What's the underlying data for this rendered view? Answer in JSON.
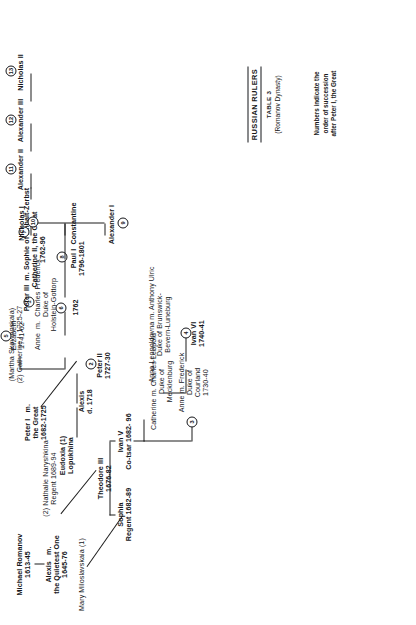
{
  "legend": {
    "title": "RUSSIAN RULERS",
    "table": "TABLE 3",
    "dynasty": "(Romanov Dynasty)",
    "note_line1": "Numbers indicate the",
    "note_line2": "order of succession",
    "note_line3": "after Peter I, the Great"
  },
  "tree": {
    "founder": "Michael Romanov\n1613-45",
    "alexis": "Alexis   m.\nthe Quietest One\n1645-76",
    "alexis_m_prefix": "m.",
    "wife1": "Mary Miloslavskaia (1)",
    "wife2": "(2) Nathalie Naryshkina\nRegent 1689-94",
    "sophia": "Sophia\nRegent 1682-89",
    "theodore": "Theodore III\n1676-82",
    "ivan5": "Ivan V\nCo-tsar 1682- 96",
    "catherine_mecklenburg": "Catherine m. Charles Leopold\nDuke of\nMecklenburg",
    "anne_courland": "Anne m. Frederick\nDuke of\nCourland\n1730-40",
    "anna_leopoldovna": "Anna Leopoldovna m. Anthony Ulric\nDuke of Brunswick-\nBevern-Luneburg",
    "ivan6": "Ivan VI\n1740-41",
    "eudoxia": "Eudoxia (1)\nLopukhina",
    "peter1": "Peter I   m.\nthe Great\n1682-1725",
    "catherine1": "(Martha Skavronskaia)\n(2) Catherine I  1725-27",
    "alexis_son": "Alexis\nd. 1718",
    "peter2": "Peter II\n1727-30",
    "anne_holstein": "Anne  m.  Charles Frederick\nDuke of\nHolstein-Gottorp",
    "elizabeth": "Elizabeth\n1741-62",
    "peter3": "Peter III  m. Sophie of Anhalt-Zerbst\nCatherine II, the Great\n1762-96",
    "peter3_year": "1762",
    "paul1": "Paul I\n1796-1801",
    "alexander1": "Alexander I",
    "constantine": "Constantine",
    "nicholas1": "Nicholas I",
    "alexander2": "Alexander II",
    "alexander3": "Alexander III",
    "nicholas2": "Nicholas II"
  },
  "succession": {
    "n1": "1",
    "n2": "2",
    "n3": "3",
    "n4": "4",
    "n5": "5",
    "n6": "6",
    "n7": "7",
    "n8": "8",
    "n9": "9",
    "n10": "10",
    "n11": "11",
    "n12": "12",
    "n13": "13"
  }
}
